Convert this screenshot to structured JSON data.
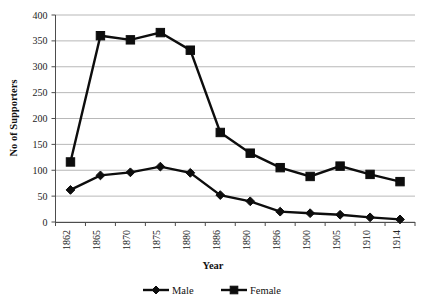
{
  "chart_data": {
    "type": "line",
    "title": "",
    "xlabel": "Year",
    "ylabel": "No of Supporters",
    "categories": [
      "1862",
      "1865",
      "1870",
      "1875",
      "1880",
      "1886",
      "1890",
      "1896",
      "1900",
      "1905",
      "1910",
      "1914"
    ],
    "series": [
      {
        "name": "Male",
        "marker": "diamond",
        "color": "#0d0d0d",
        "values": [
          62,
          90,
          96,
          107,
          95,
          52,
          40,
          20,
          17,
          14,
          9,
          5
        ]
      },
      {
        "name": "Female",
        "marker": "square",
        "color": "#0d0d0d",
        "values": [
          116,
          360,
          352,
          366,
          332,
          173,
          133,
          105,
          88,
          108,
          92,
          78
        ]
      }
    ],
    "ylim": [
      0,
      400
    ],
    "yticks": [
      0,
      50,
      100,
      150,
      200,
      250,
      300,
      350,
      400
    ],
    "ytick_labels": [
      "0",
      "50",
      "100",
      "150",
      "200",
      "250",
      "300",
      "350",
      "400"
    ],
    "grid": true,
    "grid_axis": "y",
    "legend_position": "bottom",
    "legend": [
      "Male",
      "Female"
    ]
  },
  "axes": {
    "y_title": "No of Supporters",
    "x_title": "Year"
  }
}
